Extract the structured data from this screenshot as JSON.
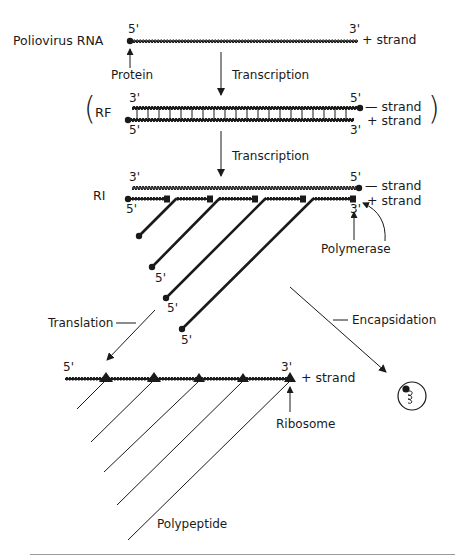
{
  "figure": {
    "stages": {
      "viral_rna": {
        "label": "Poliovirus RNA",
        "left_end": "5'",
        "right_end": "3'",
        "strand_label": "+ strand",
        "protein_label": "Protein"
      },
      "arrow1": {
        "label": "Transcription"
      },
      "rf": {
        "label": "RF",
        "top_left_end": "3'",
        "top_right_end": "5'",
        "bottom_left_end": "5'",
        "bottom_right_end": "3'",
        "top_strand_label": "— strand",
        "bottom_strand_label": "+ strand",
        "open_paren": "(",
        "close_paren": ")"
      },
      "arrow2": {
        "label": "Transcription"
      },
      "ri": {
        "label": "RI",
        "top_left_end": "3'",
        "top_right_end": "5'",
        "bottom_left_end": "5'",
        "bottom_right_end": "3'",
        "top_strand_label": "— strand",
        "bottom_strand_label": "+ strand",
        "polymerase_label": "Polymerase",
        "nascent_strand_ends": [
          "5'",
          "5'",
          "5'"
        ]
      },
      "translation": {
        "label": "Translation"
      },
      "encapsidation": {
        "label": "Encapsidation"
      },
      "polysome": {
        "left_end": "5'",
        "right_end": "3'",
        "strand_label": "+ strand",
        "ribosome_label": "Ribosome",
        "polypeptide_label": "Polypeptide",
        "ribosome_count": 5
      }
    }
  },
  "colors": {
    "ink": "#1a1a1a",
    "background": "#ffffff",
    "rule": "#9a9a9a"
  }
}
